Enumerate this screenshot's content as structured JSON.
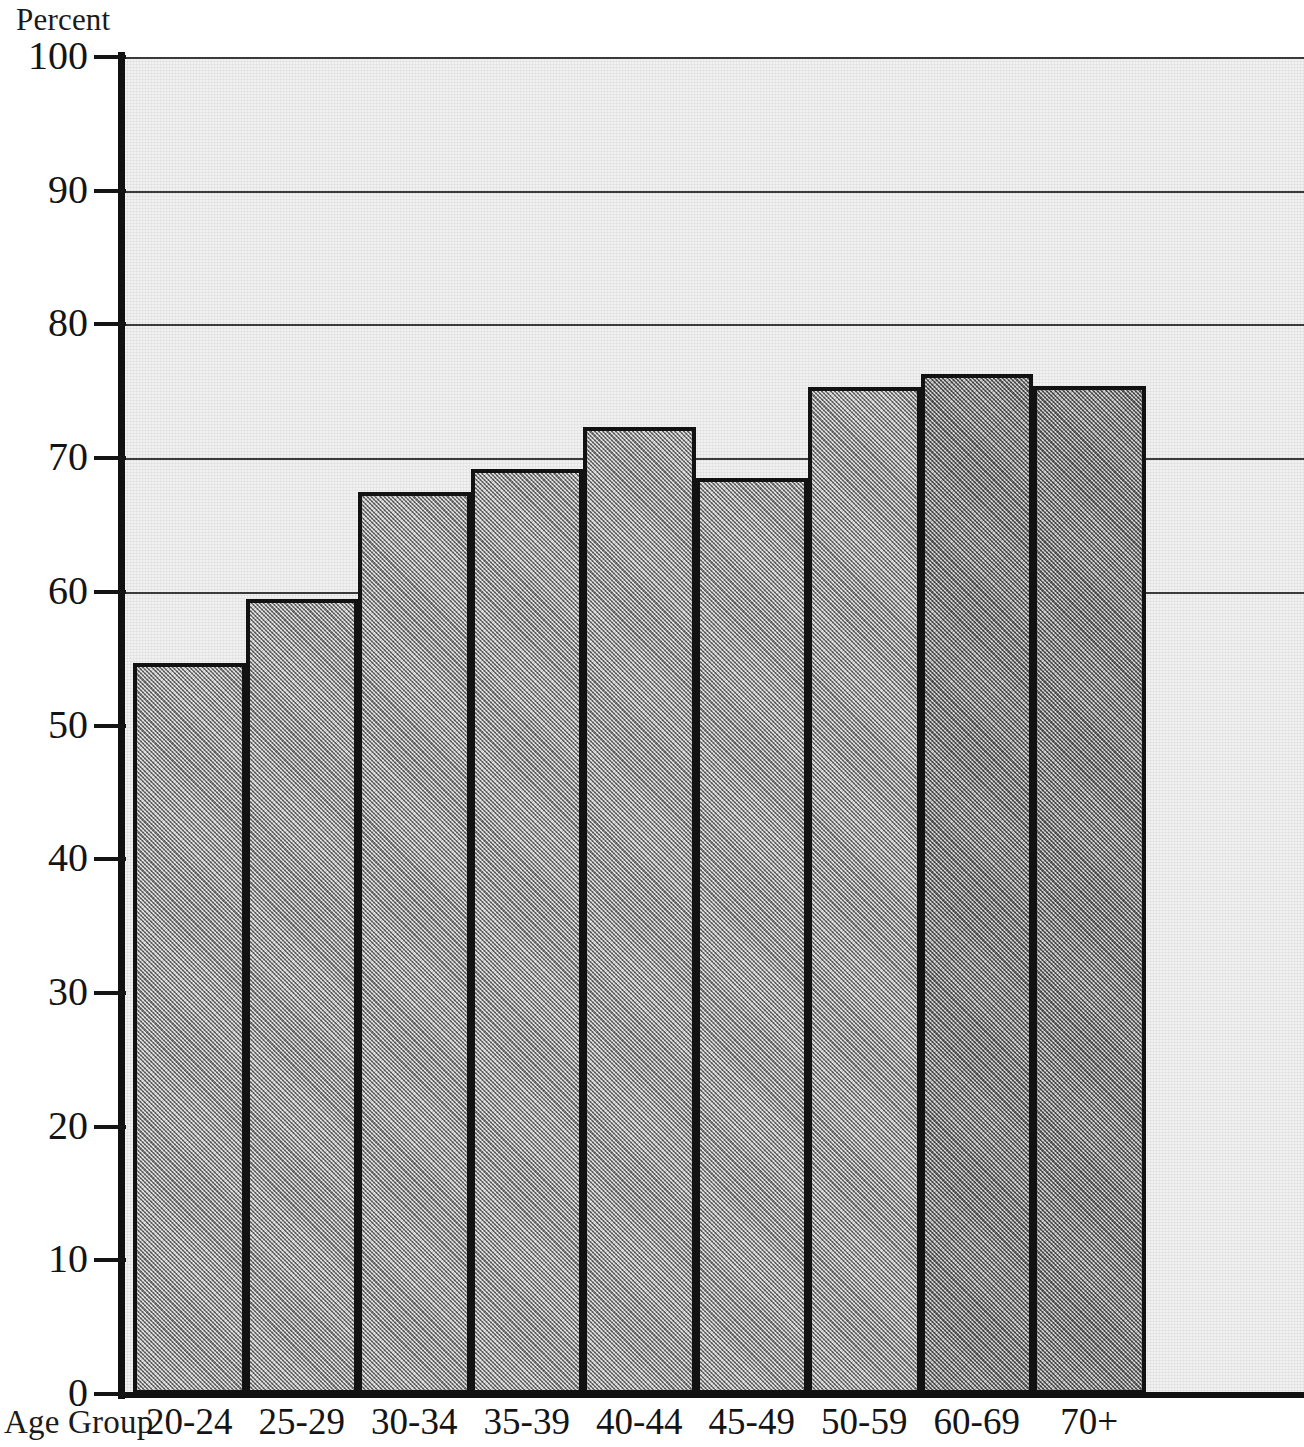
{
  "chart_data": {
    "type": "bar",
    "title": "",
    "ylabel": "Percent",
    "xlabel": "Age Group",
    "categories": [
      "20-24",
      "25-29",
      "30-34",
      "35-39",
      "40-44",
      "45-49",
      "50-59",
      "60-69",
      "70+"
    ],
    "values": [
      54.7,
      59.5,
      67.5,
      69.2,
      72.3,
      68.5,
      75.3,
      76.3,
      75.4
    ],
    "ylim": [
      0,
      100
    ],
    "yticks": [
      0,
      10,
      20,
      30,
      40,
      50,
      60,
      70,
      80,
      90,
      100
    ],
    "ytick_labels": [
      "0",
      "10",
      "20",
      "30",
      "40",
      "50",
      "60",
      "70",
      "80",
      "90",
      "100"
    ],
    "gridlines_at": [
      60,
      70,
      80,
      90,
      100
    ],
    "grid": true,
    "legend": null,
    "bar_fill_color": "#aaaaaa",
    "bar_outline_color": "#121212",
    "plot_background_color": "#f1f1f1",
    "note": "Last bar (70+) is clipped by the right edge of the image."
  },
  "axis": {
    "y_title": "Percent",
    "x_title": "Age Group"
  }
}
